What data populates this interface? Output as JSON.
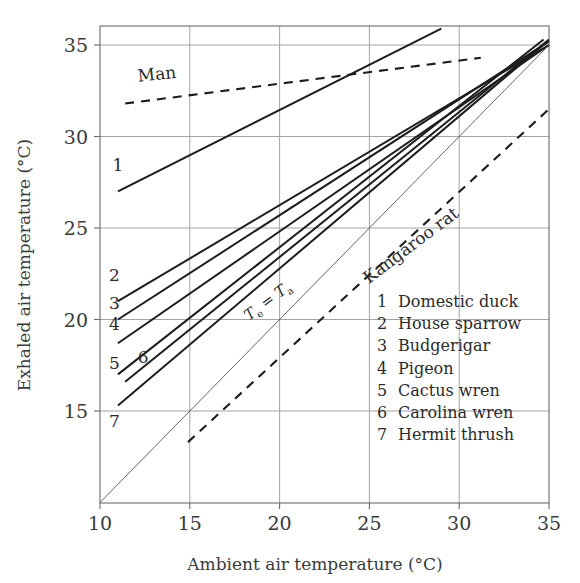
{
  "chart_data": {
    "type": "line",
    "title": "",
    "xlabel": "Ambient air temperature (°C)",
    "ylabel": "Exhaled air temperature (°C)",
    "xlim": [
      10,
      35
    ],
    "ylim": [
      10,
      36
    ],
    "xticks": [
      10,
      15,
      20,
      25,
      30,
      35
    ],
    "yticks": [
      15,
      20,
      25,
      30,
      35
    ],
    "xticklabels": [
      "10",
      "15",
      "20",
      "25",
      "30",
      "35"
    ],
    "yticklabels": [
      "15",
      "20",
      "25",
      "30",
      "35"
    ],
    "grid": true,
    "legend_position": "inside-lower-right",
    "annotations": [
      {
        "text": "Man",
        "x": 13.2,
        "y": 33.1,
        "rotation": -6
      },
      {
        "text": "Kangaroo rat",
        "x": 27.5,
        "y": 23.8,
        "rotation": -37
      },
      {
        "text": "Te = Ta",
        "x": 19.5,
        "y": 20.8,
        "rotation": -37
      }
    ],
    "series": [
      {
        "name": "Domestic duck",
        "number": "1",
        "style": "solid",
        "label_x": 11.0,
        "label_y": 28.1,
        "points": [
          [
            11.0,
            27.0
          ],
          [
            29.0,
            35.9
          ]
        ]
      },
      {
        "name": "House sparrow",
        "number": "2",
        "style": "solid",
        "label_x": 10.8,
        "label_y": 22.1,
        "points": [
          [
            11.0,
            21.0
          ],
          [
            35.0,
            35.0
          ]
        ]
      },
      {
        "name": "Budgerigar",
        "number": "3",
        "style": "solid",
        "label_x": 10.8,
        "label_y": 20.6,
        "points": [
          [
            11.0,
            20.0
          ],
          [
            35.0,
            35.2
          ]
        ]
      },
      {
        "name": "Pigeon",
        "number": "4",
        "style": "solid",
        "label_x": 10.8,
        "label_y": 19.4,
        "points": [
          [
            11.0,
            18.7
          ],
          [
            35.0,
            35.0
          ]
        ]
      },
      {
        "name": "Cactus wren",
        "number": "5",
        "style": "solid",
        "label_x": 10.8,
        "label_y": 17.3,
        "points": [
          [
            11.0,
            17.0
          ],
          [
            34.7,
            35.3
          ]
        ]
      },
      {
        "name": "Carolina wren",
        "number": "6",
        "style": "solid",
        "label_x": 12.4,
        "label_y": 17.6,
        "points": [
          [
            11.4,
            16.6
          ],
          [
            35.0,
            35.3
          ]
        ]
      },
      {
        "name": "Hermit thrush",
        "number": "7",
        "style": "solid",
        "label_x": 10.8,
        "label_y": 14.1,
        "points": [
          [
            11.0,
            15.3
          ],
          [
            34.8,
            35.1
          ]
        ]
      },
      {
        "name": "Man",
        "number": "",
        "style": "dashed",
        "label_x": 13.2,
        "label_y": 33.1,
        "points": [
          [
            11.4,
            31.8
          ],
          [
            31.2,
            34.3
          ]
        ]
      },
      {
        "name": "Kangaroo rat",
        "number": "",
        "style": "dashed",
        "label_x": 27.5,
        "label_y": 23.8,
        "points": [
          [
            14.9,
            13.3
          ],
          [
            35.0,
            31.5
          ]
        ]
      },
      {
        "name": "Te = Ta",
        "number": "",
        "style": "identity",
        "label_x": 19.5,
        "label_y": 20.8,
        "points": [
          [
            10.0,
            10.0
          ],
          [
            35.0,
            35.0
          ]
        ]
      }
    ],
    "legend_entries": [
      {
        "number": "1",
        "label": "Domestic duck"
      },
      {
        "number": "2",
        "label": "House sparrow"
      },
      {
        "number": "3",
        "label": "Budgerigar"
      },
      {
        "number": "4",
        "label": "Pigeon"
      },
      {
        "number": "5",
        "label": "Cactus wren"
      },
      {
        "number": "6",
        "label": "Carolina wren"
      },
      {
        "number": "7",
        "label": "Hermit thrush"
      }
    ],
    "colors": {
      "line": "#1c1c1c",
      "grid": "#9a9a9a",
      "axis": "#6b6b6b",
      "text": "#2b2b2b",
      "background": "#ffffff"
    }
  }
}
